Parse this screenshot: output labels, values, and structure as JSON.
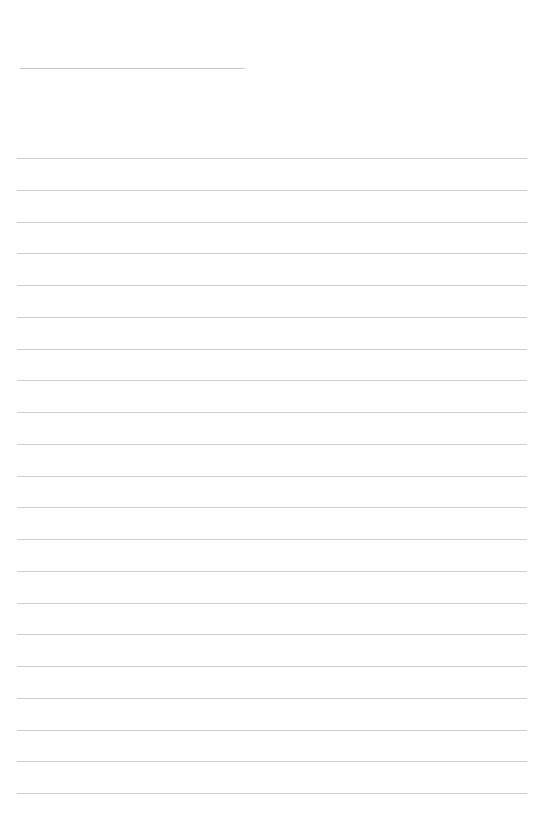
{
  "page": {
    "type": "lined-paper",
    "title": "",
    "background": "#ffffff",
    "line_color": "#cfcfcf",
    "header_line": {
      "x": 20,
      "y": 68,
      "width": 225
    },
    "ruled_lines": {
      "count": 21,
      "start_y": 158,
      "spacing": 31.75,
      "x": 17,
      "width": 510
    }
  }
}
